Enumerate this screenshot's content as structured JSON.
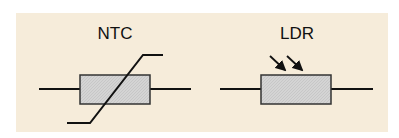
{
  "diagram": {
    "background_color": "#f6ecda",
    "body_fill_color": "#d4d4d4",
    "line_color": "#111111",
    "symbols": [
      {
        "id": "ntc",
        "label": "NTC",
        "kind": "thermistor",
        "marker": "diagonal-slash-with-tails"
      },
      {
        "id": "ldr",
        "label": "LDR",
        "kind": "light-dependent-resistor",
        "marker": "two-incoming-light-arrows"
      }
    ]
  }
}
